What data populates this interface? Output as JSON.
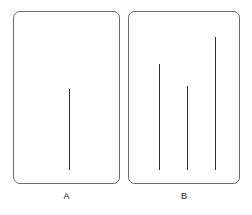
{
  "figure": {
    "kind": "line-length-comparison-figure",
    "background_color": "#ffffff",
    "line_color": "#303030",
    "card_border_color": "#6b6b6b",
    "panels": [
      {
        "id": "panel-a",
        "label": "A",
        "role": "standard",
        "card": {
          "x": 13,
          "y": 11,
          "width": 107,
          "height": 173
        },
        "lines": [
          {
            "name": "standard-line",
            "x": 69,
            "top": 89,
            "bottom": 170,
            "length_px": 81
          }
        ]
      },
      {
        "id": "panel-b",
        "label": "B",
        "role": "comparison",
        "card": {
          "x": 128,
          "y": 11,
          "width": 112,
          "height": 173
        },
        "lines": [
          {
            "name": "comparison-line-1",
            "x": 159,
            "top": 64,
            "bottom": 170,
            "length_px": 106
          },
          {
            "name": "comparison-line-2",
            "x": 187,
            "top": 86,
            "bottom": 170,
            "length_px": 84
          },
          {
            "name": "comparison-line-3",
            "x": 215,
            "top": 37,
            "bottom": 170,
            "length_px": 133
          }
        ]
      }
    ]
  },
  "chart_data": {
    "type": "bar",
    "title": "",
    "xlabel": "",
    "ylabel": "Line length (px)",
    "categories": [
      "A: standard",
      "B: line 1",
      "B: line 2",
      "B: line 3"
    ],
    "values": [
      81,
      106,
      84,
      133
    ],
    "ylim": [
      0,
      140
    ],
    "grid": false,
    "legend": "none",
    "annotations": [
      "Panel A contains one standard vertical line.",
      "Panel B contains three vertical comparison lines of differing lengths, all bottom-aligned."
    ]
  }
}
